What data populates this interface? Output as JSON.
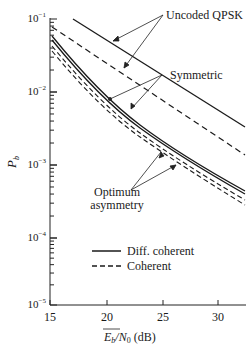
{
  "chart_data": {
    "type": "line",
    "title": "",
    "xlabel": "Eb/N0 (dB)",
    "ylabel": "Pb",
    "xlim": [
      15,
      32.5
    ],
    "ylim": [
      1e-05,
      0.1
    ],
    "yscale": "log",
    "x_ticks": [
      15,
      20,
      25,
      30
    ],
    "x_tick_labels": [
      "15",
      "20",
      "25",
      "30"
    ],
    "y_ticks": [
      0.1,
      0.01,
      0.001,
      0.0001,
      1e-05
    ],
    "y_tick_labels": [
      "10-1",
      "10-2",
      "10-3",
      "10-4",
      "10-5"
    ],
    "grid": false,
    "legend": [
      {
        "label": "Diff. coherent",
        "style": "solid"
      },
      {
        "label": "Coherent",
        "style": "dashed"
      }
    ],
    "legend_position": "lower center",
    "annotations": [
      "Uncoded QPSK",
      "Symmetric",
      "Optimum asymmetry"
    ],
    "series": [
      {
        "name": "Uncoded QPSK (Diff. coherent)",
        "style": "solid",
        "x": [
          17,
          20,
          25,
          30,
          32.4
        ],
        "values": [
          0.1,
          0.047,
          0.0143,
          0.0046,
          0.0032
        ]
      },
      {
        "name": "Uncoded QPSK (Coherent)",
        "style": "dashed",
        "x": [
          15.2,
          20,
          25,
          30,
          32.4
        ],
        "values": [
          0.077,
          0.035,
          0.0095,
          0.0027,
          0.0016
        ]
      },
      {
        "name": "Symmetric (Diff. coherent)",
        "style": "solid",
        "x": [
          15.2,
          20,
          25,
          30,
          32.4
        ],
        "values": [
          0.055,
          0.0078,
          0.0021,
          0.00065,
          0.0004
        ]
      },
      {
        "name": "Optimum asymmetry (Diff. coherent)",
        "style": "solid",
        "x": [
          15.2,
          20,
          25,
          30,
          32.4
        ],
        "values": [
          0.05,
          0.007,
          0.0019,
          0.0006,
          0.00037
        ]
      },
      {
        "name": "Symmetric (Coherent)",
        "style": "dashed",
        "x": [
          15.2,
          20,
          25,
          30,
          32.4
        ],
        "values": [
          0.042,
          0.0058,
          0.0016,
          0.0005,
          0.0003
        ]
      },
      {
        "name": "Optimum asymmetry (Coherent)",
        "style": "dashed",
        "x": [
          15.2,
          20,
          25,
          30,
          32.4
        ],
        "values": [
          0.036,
          0.005,
          0.0014,
          0.00043,
          0.00026
        ]
      }
    ]
  },
  "labels": {
    "ylabel": "P",
    "ylabel_sub": "b",
    "xlabel_main": "E",
    "xlabel_sub": "b",
    "xlabel_rest": "/N",
    "xlabel_sub2": "0",
    "xlabel_unit": " (dB)",
    "ann_uncoded": "Uncoded QPSK",
    "ann_symmetric": "Symmetric",
    "ann_optimum_1": "Optimum",
    "ann_optimum_2": "asymmetry",
    "legend_solid": "Diff. coherent",
    "legend_dashed": "Coherent",
    "x_ticks": [
      "15",
      "20",
      "25",
      "30"
    ],
    "y_ticks": [
      "10",
      "10",
      "10",
      "10",
      "10"
    ],
    "y_exps": [
      "−1",
      "−2",
      "−3",
      "−4",
      "−5"
    ]
  }
}
